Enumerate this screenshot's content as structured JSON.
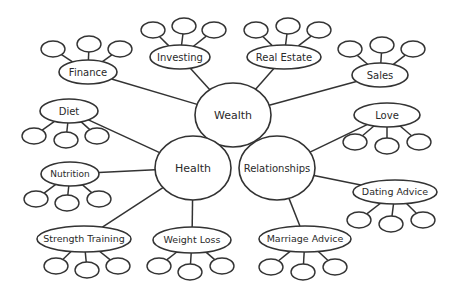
{
  "diagram": {
    "type": "mind-map",
    "colors": {
      "stroke": "#333333",
      "fill": "#ffffff",
      "text": "#2a2a2a",
      "background": "#ffffff"
    },
    "hubs": [
      {
        "id": "wealth",
        "label": "Wealth",
        "cx": 233,
        "cy": 115,
        "rx": 38,
        "ry": 32
      },
      {
        "id": "health",
        "label": "Health",
        "cx": 193,
        "cy": 168,
        "rx": 38,
        "ry": 32
      },
      {
        "id": "relationships",
        "label": "Relationships",
        "cx": 277,
        "cy": 168,
        "rx": 38,
        "ry": 32
      }
    ],
    "topics": [
      {
        "id": "finance",
        "label": "Finance",
        "hub": "wealth",
        "cx": 88,
        "cy": 72,
        "rx": 29,
        "ry": 12,
        "font": 10,
        "leaves": [
          {
            "cx": 53,
            "cy": 49
          },
          {
            "cx": 89,
            "cy": 44
          },
          {
            "cx": 120,
            "cy": 49
          }
        ]
      },
      {
        "id": "investing",
        "label": "Investing",
        "hub": "wealth",
        "cx": 180,
        "cy": 57,
        "rx": 30,
        "ry": 12,
        "font": 10,
        "leaves": [
          {
            "cx": 153,
            "cy": 30
          },
          {
            "cx": 184,
            "cy": 26
          },
          {
            "cx": 214,
            "cy": 30
          }
        ]
      },
      {
        "id": "real-estate",
        "label": "Real Estate",
        "hub": "wealth",
        "cx": 284,
        "cy": 57,
        "rx": 37,
        "ry": 12,
        "font": 10,
        "leaves": [
          {
            "cx": 256,
            "cy": 30
          },
          {
            "cx": 288,
            "cy": 26
          },
          {
            "cx": 319,
            "cy": 30
          }
        ]
      },
      {
        "id": "sales",
        "label": "Sales",
        "hub": "wealth",
        "cx": 380,
        "cy": 75,
        "rx": 28,
        "ry": 12,
        "font": 10,
        "leaves": [
          {
            "cx": 350,
            "cy": 49
          },
          {
            "cx": 382,
            "cy": 45
          },
          {
            "cx": 413,
            "cy": 49
          }
        ]
      },
      {
        "id": "diet",
        "label": "Diet",
        "hub": "health",
        "cx": 69,
        "cy": 111,
        "rx": 29,
        "ry": 12,
        "font": 10,
        "leaves": [
          {
            "cx": 34,
            "cy": 136
          },
          {
            "cx": 66,
            "cy": 140
          },
          {
            "cx": 97,
            "cy": 136
          }
        ]
      },
      {
        "id": "nutrition",
        "label": "Nutrition",
        "hub": "health",
        "cx": 70,
        "cy": 174,
        "rx": 29,
        "ry": 12,
        "font": 9,
        "leaves": [
          {
            "cx": 36,
            "cy": 199
          },
          {
            "cx": 67,
            "cy": 203
          },
          {
            "cx": 99,
            "cy": 199
          }
        ]
      },
      {
        "id": "strength-training",
        "label": "Strength Training",
        "hub": "health",
        "cx": 84,
        "cy": 239,
        "rx": 47,
        "ry": 13,
        "font": 9.5,
        "leaves": [
          {
            "cx": 56,
            "cy": 266
          },
          {
            "cx": 87,
            "cy": 270
          },
          {
            "cx": 118,
            "cy": 266
          }
        ]
      },
      {
        "id": "weight-loss",
        "label": "Weight Loss",
        "hub": "health",
        "cx": 192,
        "cy": 240,
        "rx": 39,
        "ry": 13,
        "font": 9.5,
        "leaves": [
          {
            "cx": 159,
            "cy": 266
          },
          {
            "cx": 190,
            "cy": 272
          },
          {
            "cx": 222,
            "cy": 266
          }
        ]
      },
      {
        "id": "love",
        "label": "Love",
        "hub": "relationships",
        "cx": 387,
        "cy": 115,
        "rx": 33,
        "ry": 12,
        "font": 10,
        "leaves": [
          {
            "cx": 355,
            "cy": 142
          },
          {
            "cx": 387,
            "cy": 146
          },
          {
            "cx": 419,
            "cy": 142
          }
        ]
      },
      {
        "id": "dating-advice",
        "label": "Dating Advice",
        "hub": "relationships",
        "cx": 395,
        "cy": 192,
        "rx": 42,
        "ry": 12,
        "font": 9.5,
        "leaves": [
          {
            "cx": 359,
            "cy": 220
          },
          {
            "cx": 391,
            "cy": 224
          },
          {
            "cx": 423,
            "cy": 220
          }
        ]
      },
      {
        "id": "marriage-advice",
        "label": "Marriage Advice",
        "hub": "relationships",
        "cx": 305,
        "cy": 239,
        "rx": 46,
        "ry": 13,
        "font": 9.5,
        "leaves": [
          {
            "cx": 271,
            "cy": 267
          },
          {
            "cx": 303,
            "cy": 272
          },
          {
            "cx": 335,
            "cy": 267
          }
        ]
      }
    ],
    "leaf_size": {
      "rx": 12,
      "ry": 8
    }
  }
}
